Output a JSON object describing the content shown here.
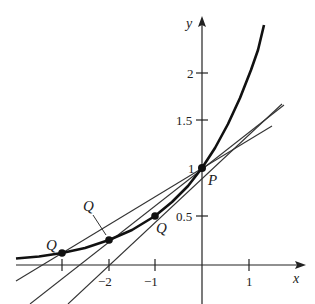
{
  "figure": {
    "function": "y = 2^x",
    "axis_labels": {
      "x": "x",
      "y": "y"
    },
    "x_ticks": [
      {
        "value": -3,
        "label": ""
      },
      {
        "value": -2,
        "label": "−2"
      },
      {
        "value": -1,
        "label": "−1"
      },
      {
        "value": 1,
        "label": "1"
      }
    ],
    "y_ticks": [
      {
        "value": 0.5,
        "label": "0.5"
      },
      {
        "value": 1,
        "label": "1"
      },
      {
        "value": 1.5,
        "label": "1.5"
      },
      {
        "value": 2,
        "label": "2"
      }
    ],
    "points": [
      {
        "name": "P",
        "x": 0,
        "y": 1
      },
      {
        "name": "Q",
        "x": -1,
        "y": 0.5
      },
      {
        "name": "Q",
        "x": -2,
        "y": 0.25
      },
      {
        "name": "Q",
        "x": -3,
        "y": 0.125
      }
    ],
    "secant_lines": [
      {
        "from": "Q(-1,0.5)",
        "to": "P(0,1)",
        "slope": 0.5
      },
      {
        "from": "Q(-2,0.25)",
        "to": "P(0,1)",
        "slope": 0.375
      },
      {
        "from": "Q(-3,0.125)",
        "to": "P(0,1)",
        "slope": 0.2917
      }
    ],
    "colors": {
      "curve": "#111111",
      "lines": "#333333",
      "axes": "#222222"
    }
  }
}
